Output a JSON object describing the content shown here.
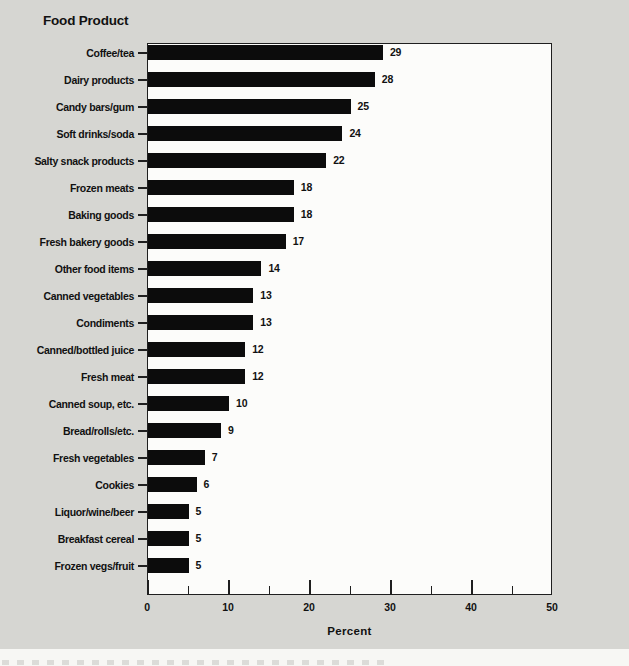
{
  "chart_data": {
    "type": "bar",
    "orientation": "horizontal",
    "title": "Food Product",
    "xlabel": "Percent",
    "xlim": [
      0,
      50
    ],
    "x_major_ticks": [
      0,
      10,
      20,
      30,
      40,
      50
    ],
    "x_minor_ticks": [
      5,
      15,
      25,
      35,
      45
    ],
    "grid": false,
    "legend": false,
    "categories": [
      "Coffee/tea",
      "Dairy products",
      "Candy bars/gum",
      "Soft drinks/soda",
      "Salty snack products",
      "Frozen meats",
      "Baking goods",
      "Fresh bakery goods",
      "Other food items",
      "Canned vegetables",
      "Condiments",
      "Canned/bottled juice",
      "Fresh meat",
      "Canned soup, etc.",
      "Bread/rolls/etc.",
      "Fresh vegetables",
      "Cookies",
      "Liquor/wine/beer",
      "Breakfast cereal",
      "Frozen vegs/fruit"
    ],
    "values": [
      29,
      28,
      25,
      24,
      22,
      18,
      18,
      17,
      14,
      13,
      13,
      12,
      12,
      10,
      9,
      7,
      6,
      5,
      5,
      5
    ],
    "value_labels": [
      "29",
      "28",
      "25",
      "24",
      "22",
      "18",
      "18",
      "17",
      "14",
      "13",
      "13",
      "12",
      "12",
      "10",
      "9",
      "7",
      "6",
      "5",
      "5",
      "5"
    ],
    "colors": {
      "bar": "#0c0c0c",
      "plot_bg": "#fcfcfa",
      "page_bg": "#d6d6d2",
      "axis_line": "#1f1f1f",
      "text": "#111111"
    }
  }
}
